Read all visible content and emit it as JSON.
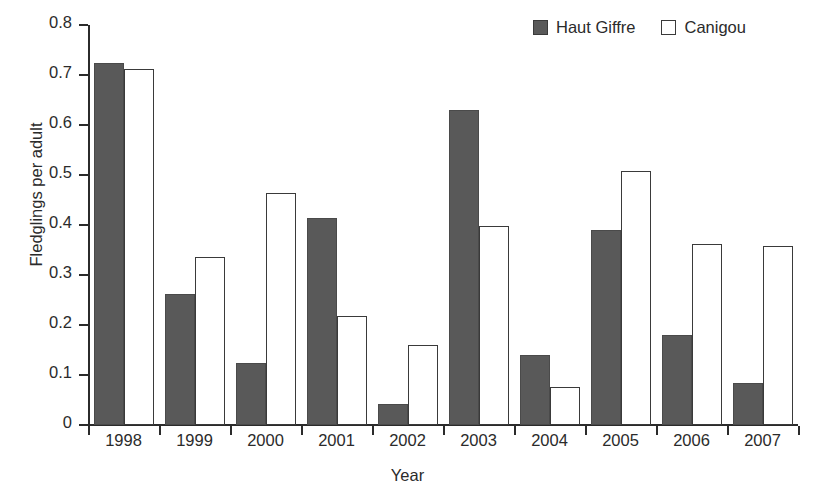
{
  "chart_data": {
    "type": "bar",
    "title": "",
    "xlabel": "Year",
    "ylabel": "Fledglings per adult",
    "categories": [
      "1998",
      "1999",
      "2000",
      "2001",
      "2002",
      "2003",
      "2004",
      "2005",
      "2006",
      "2007"
    ],
    "series": [
      {
        "name": "Haut Giffre",
        "color": "#595959",
        "style": "filled",
        "values": [
          0.725,
          0.262,
          0.125,
          0.414,
          0.042,
          0.63,
          0.141,
          0.39,
          0.18,
          0.085
        ]
      },
      {
        "name": "Canigou",
        "color": "#ffffff",
        "style": "hollow",
        "values": [
          0.713,
          0.336,
          0.465,
          0.218,
          0.161,
          0.398,
          0.077,
          0.508,
          0.362,
          0.359
        ]
      }
    ],
    "ylim": [
      0,
      0.8
    ],
    "yticks": [
      0,
      0.1,
      0.2,
      0.3,
      0.4,
      0.5,
      0.6,
      0.7,
      0.8
    ],
    "ytick_labels": [
      "0",
      "0.1",
      "0.2",
      "0.3",
      "0.4",
      "0.5",
      "0.6",
      "0.7",
      "0.8"
    ],
    "grid": false,
    "legend_position": "top-right"
  },
  "legend": {
    "entries": [
      {
        "label": "Haut Giffre"
      },
      {
        "label": "Canigou"
      }
    ]
  }
}
